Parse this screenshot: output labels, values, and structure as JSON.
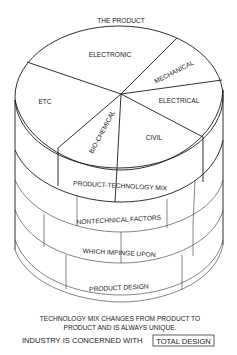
{
  "diagram": {
    "title": "THE PRODUCT",
    "pie_segments": [
      {
        "label": "ELECTRONIC"
      },
      {
        "label": "MECHANICAL"
      },
      {
        "label": "ELECTRICAL"
      },
      {
        "label": "CIVIL"
      },
      {
        "label": "BIO-CHEMICAL"
      },
      {
        "label": "ETC"
      }
    ],
    "layers": [
      {
        "label": "PRODUCT-TECHNOLOGY MIX"
      },
      {
        "label": "NONTECHNICAL FACTORS"
      },
      {
        "label": "WHICH IMPINGE UPON"
      },
      {
        "label": "PRODUCT DESIGN"
      }
    ],
    "caption_line1": "TECHNOLOGY MIX CHANGES FROM PRODUCT TO",
    "caption_line2": "PRODUCT AND IS ALWAYS UNIQUE.",
    "caption_line3_prefix": "INDUSTRY IS CONCERNED WITH",
    "caption_line3_boxed": "TOTAL DESIGN"
  }
}
